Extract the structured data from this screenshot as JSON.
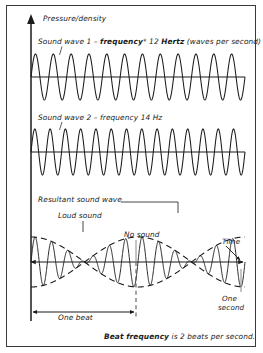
{
  "figure": {
    "title_axis_y": "Pressure/density",
    "axis_time_label": "Time",
    "colors": {
      "ink": "#1b1b1b",
      "border": "#3a3a3a",
      "leader": "#8a8a8a",
      "background": "#ffffff"
    }
  },
  "wave1": {
    "label_prefix": "Sound wave 1 – ",
    "label_bold1": "frequency",
    "label_star": "*",
    "label_mid": " 12 ",
    "label_bold2": "Hertz",
    "label_suffix": " (waves per second)",
    "frequency_hz": 12,
    "full_label": "Sound wave 1 – frequency* 12 Hertz (waves per second)"
  },
  "wave2": {
    "full_label": "Sound wave 2 – frequency 14 Hz",
    "frequency_hz": 14
  },
  "resultant": {
    "label": "Resultant sound wave",
    "loud_label": "Loud sound",
    "node_label": "No sound",
    "beat_label": "One beat",
    "second_label_line1": "One",
    "second_label_line2": "second"
  },
  "caption": {
    "bold": "Beat frequency",
    "rest": " is 2 beats per second.",
    "full": "Beat frequency is 2 beats per second."
  },
  "chart_data": {
    "type": "line",
    "xlabel": "Time",
    "ylabel": "Pressure/density",
    "x_range_seconds": [
      0,
      1
    ],
    "grid": false,
    "legend": "none",
    "series": [
      {
        "name": "Sound wave 1",
        "frequency_hz": 12,
        "amplitude": 1,
        "waveform": "sine"
      },
      {
        "name": "Sound wave 2",
        "frequency_hz": 14,
        "amplitude": 1,
        "waveform": "sine"
      },
      {
        "name": "Resultant sound wave",
        "frequency_hz": 13,
        "amplitude": 2,
        "waveform": "sine_beat",
        "beat_frequency_hz": 2,
        "envelope_frequency_hz": 1
      }
    ],
    "annotations": [
      {
        "text": "Loud sound",
        "x_seconds": 0.25,
        "note": "antinode / constructive interference"
      },
      {
        "text": "No sound",
        "x_seconds": 0.5,
        "note": "node / destructive interference"
      },
      {
        "text": "One beat",
        "x_seconds": [
          0.0,
          0.5
        ],
        "note": "one beat period = 0.5 s"
      },
      {
        "text": "One second",
        "x_seconds": 1.0,
        "note": "total span shown"
      }
    ]
  }
}
